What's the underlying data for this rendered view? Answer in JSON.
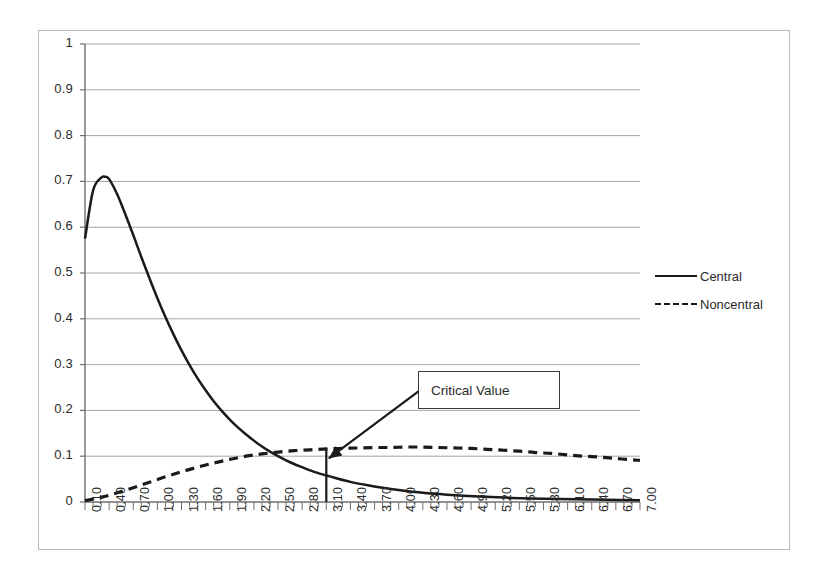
{
  "chart_data": {
    "type": "line",
    "title": "",
    "xlabel": "",
    "ylabel": "",
    "xlim": [
      0.1,
      7.0
    ],
    "ylim": [
      0,
      1
    ],
    "grid": true,
    "legend_position": "right",
    "y_ticks": [
      "1",
      "0.9",
      "0.8",
      "0.7",
      "0.6",
      "0.5",
      "0.4",
      "0.3",
      "0.2",
      "0.1",
      "0"
    ],
    "y_tick_values": [
      1,
      0.9,
      0.8,
      0.7,
      0.6,
      0.5,
      0.4,
      0.3,
      0.2,
      0.1,
      0
    ],
    "x_ticks": [
      "0.10",
      "0.40",
      "0.70",
      "1.00",
      "1.30",
      "1.60",
      "1.90",
      "2.20",
      "2.50",
      "2.80",
      "3.10",
      "3.40",
      "3.70",
      "4.00",
      "4.30",
      "4.60",
      "4.90",
      "5.20",
      "5.50",
      "5.80",
      "6.10",
      "6.40",
      "6.70",
      "7.00"
    ],
    "x_tick_values": [
      0.1,
      0.4,
      0.7,
      1.0,
      1.3,
      1.6,
      1.9,
      2.2,
      2.5,
      2.8,
      3.1,
      3.4,
      3.7,
      4.0,
      4.3,
      4.6,
      4.9,
      5.2,
      5.5,
      5.8,
      6.1,
      6.4,
      6.7,
      7.0
    ],
    "x_minor_step": 0.1,
    "series": [
      {
        "name": "Central",
        "style": "solid",
        "color": "#1a1a1a",
        "x": [
          0.1,
          0.2,
          0.3,
          0.35,
          0.4,
          0.5,
          0.6,
          0.7,
          0.8,
          0.9,
          1.0,
          1.1,
          1.2,
          1.3,
          1.4,
          1.5,
          1.6,
          1.7,
          1.8,
          1.9,
          2.0,
          2.1,
          2.2,
          2.3,
          2.4,
          2.5,
          2.6,
          2.7,
          2.8,
          2.9,
          3.0,
          3.1,
          3.2,
          3.4,
          3.6,
          3.8,
          4.0,
          4.3,
          4.6,
          5.0,
          5.4,
          5.8,
          6.2,
          6.6,
          7.0
        ],
        "y": [
          0.575,
          0.68,
          0.708,
          0.71,
          0.705,
          0.672,
          0.629,
          0.583,
          0.535,
          0.489,
          0.445,
          0.404,
          0.366,
          0.331,
          0.299,
          0.27,
          0.244,
          0.22,
          0.199,
          0.18,
          0.163,
          0.148,
          0.134,
          0.121,
          0.11,
          0.1,
          0.091,
          0.083,
          0.076,
          0.069,
          0.063,
          0.058,
          0.053,
          0.044,
          0.037,
          0.031,
          0.026,
          0.02,
          0.016,
          0.012,
          0.009,
          0.007,
          0.006,
          0.005,
          0.004
        ]
      },
      {
        "name": "Noncentral",
        "style": "dashed",
        "color": "#1a1a1a",
        "x": [
          0.1,
          0.3,
          0.5,
          0.7,
          0.9,
          1.1,
          1.3,
          1.5,
          1.7,
          1.9,
          2.1,
          2.3,
          2.5,
          2.7,
          2.9,
          3.1,
          3.3,
          3.5,
          3.7,
          3.9,
          4.1,
          4.3,
          4.5,
          4.7,
          4.9,
          5.1,
          5.3,
          5.5,
          5.7,
          5.9,
          6.1,
          6.3,
          6.5,
          6.7,
          6.9,
          7.0
        ],
        "y": [
          0.003,
          0.01,
          0.02,
          0.031,
          0.043,
          0.055,
          0.066,
          0.076,
          0.085,
          0.093,
          0.1,
          0.105,
          0.109,
          0.112,
          0.114,
          0.116,
          0.117,
          0.118,
          0.119,
          0.119,
          0.12,
          0.12,
          0.119,
          0.118,
          0.117,
          0.115,
          0.113,
          0.111,
          0.108,
          0.106,
          0.103,
          0.1,
          0.098,
          0.095,
          0.092,
          0.091
        ]
      }
    ],
    "annotations": [
      {
        "label": "Critical Value",
        "x": 3.1,
        "y_top": 0.118,
        "y_bottom": 0.0,
        "arrow_from_x": 4.35,
        "arrow_from_y": 0.255,
        "arrow_to_x": 3.13,
        "arrow_to_y": 0.095
      }
    ]
  },
  "legend": {
    "items": [
      {
        "label": "Central",
        "style": "solid"
      },
      {
        "label": "Noncentral",
        "style": "dashed"
      }
    ]
  },
  "annotation": {
    "critical_value_label": "Critical Value"
  },
  "colors": {
    "series_line": "#1a1a1a",
    "gridline": "#a6a6a6",
    "axis": "#6e6e6e",
    "frame": "#b9b9b9",
    "text": "#2b2b2b",
    "background": "#ffffff"
  }
}
